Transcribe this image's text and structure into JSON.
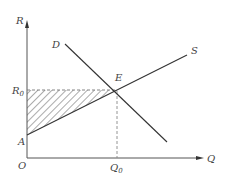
{
  "diagram": {
    "type": "supply-demand",
    "axes": {
      "y_label": "R",
      "x_label": "Q",
      "origin_label": "O"
    },
    "curves": [
      {
        "name": "supply",
        "label": "S"
      },
      {
        "name": "demand",
        "label": "D"
      }
    ],
    "points": {
      "equilibrium": "E",
      "intercept": "A",
      "price_level": {
        "base": "R",
        "sub": "0"
      },
      "quantity_level": {
        "base": "Q",
        "sub": "0"
      }
    },
    "shaded_region": "triangle A–R0–E (hatched)",
    "colors": {
      "line": "#333333",
      "axis": "#555555",
      "dashed": "#888888",
      "hatch": "#444444"
    }
  }
}
